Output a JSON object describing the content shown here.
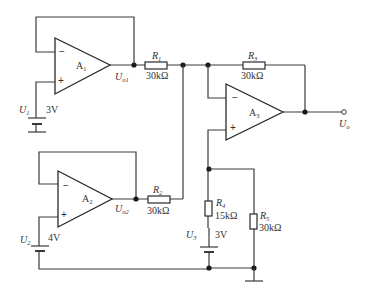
{
  "diagram": {
    "type": "circuit-schematic",
    "opamps": [
      {
        "id": "A1",
        "name": "A",
        "sub": "1",
        "config": "voltage follower",
        "output": {
          "name": "U",
          "sub": "o1"
        }
      },
      {
        "id": "A2",
        "name": "A",
        "sub": "2",
        "config": "voltage follower",
        "output": {
          "name": "U",
          "sub": "o2"
        }
      },
      {
        "id": "A3",
        "name": "A",
        "sub": "3",
        "config": "difference amplifier",
        "output": {
          "name": "U",
          "sub": "o"
        }
      }
    ],
    "resistors": [
      {
        "id": "R1",
        "name": "R",
        "sub": "1",
        "value": "30kΩ"
      },
      {
        "id": "R2",
        "name": "R",
        "sub": "2",
        "value": "30kΩ"
      },
      {
        "id": "R3",
        "name": "R",
        "sub": "3",
        "value": "30kΩ"
      },
      {
        "id": "R4",
        "name": "R",
        "sub": "4",
        "value": "15kΩ"
      },
      {
        "id": "R5",
        "name": "R",
        "sub": "5",
        "value": "30kΩ"
      }
    ],
    "sources": [
      {
        "id": "U1",
        "name": "U",
        "sub": "1",
        "value": "3V"
      },
      {
        "id": "U2",
        "name": "U",
        "sub": "2",
        "value": "4V"
      },
      {
        "id": "U3",
        "name": "U",
        "sub": "3",
        "value": "3V"
      }
    ],
    "signs": {
      "minus": "−",
      "plus": "+"
    }
  }
}
